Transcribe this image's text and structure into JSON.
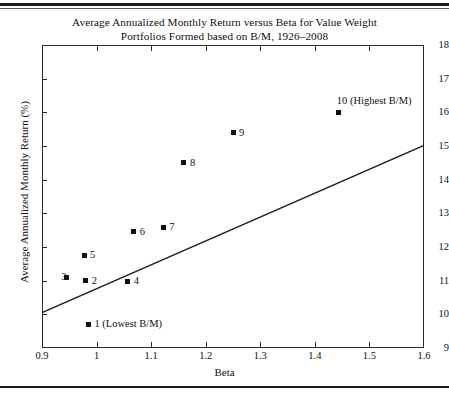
{
  "chart_data": {
    "type": "scatter",
    "title": "Average Annualized Monthly Return versus Beta for Value Weight Portfolios Formed based on B/M, 1926–2008",
    "title_line1": "Average Annualized Monthly Return versus Beta for Value Weight",
    "title_line2": "Portfolios Formed based on B/M, 1926–2008",
    "xlabel": "Beta",
    "ylabel": "Average Annualized Monthly Return (%)",
    "xlim": [
      0.9,
      1.6
    ],
    "ylim": [
      9,
      18
    ],
    "xticks": [
      0.9,
      1.0,
      1.1,
      1.2,
      1.3,
      1.4,
      1.5,
      1.6
    ],
    "xticklabels": [
      "0.9",
      "1",
      "1.1",
      "1.2",
      "1.3",
      "1.4",
      "1.5",
      "1.6"
    ],
    "yticks": [
      9,
      10,
      11,
      12,
      13,
      14,
      15,
      16,
      17,
      18
    ],
    "yticklabels": [
      "9",
      "10",
      "11",
      "12",
      "13",
      "14",
      "15",
      "16",
      "17",
      "18"
    ],
    "grid": false,
    "legend": false,
    "points": [
      {
        "label": "1 (Lowest B/M)",
        "x": 0.985,
        "y": 9.7,
        "label_pos": "right"
      },
      {
        "label": "2",
        "x": 0.98,
        "y": 11.0,
        "label_pos": "right"
      },
      {
        "label": "3",
        "x": 0.945,
        "y": 11.1,
        "label_pos": "left"
      },
      {
        "label": "4",
        "x": 1.057,
        "y": 10.98,
        "label_pos": "right"
      },
      {
        "label": "5",
        "x": 0.977,
        "y": 11.75,
        "label_pos": "right"
      },
      {
        "label": "6",
        "x": 1.068,
        "y": 12.45,
        "label_pos": "right"
      },
      {
        "label": "7",
        "x": 1.122,
        "y": 12.58,
        "label_pos": "right"
      },
      {
        "label": "8",
        "x": 1.16,
        "y": 14.5,
        "label_pos": "right"
      },
      {
        "label": "9",
        "x": 1.25,
        "y": 15.4,
        "label_pos": "right"
      },
      {
        "label": "10 (Highest B/M)",
        "x": 1.444,
        "y": 16.0,
        "label_pos": "above"
      }
    ],
    "line": {
      "name": "security-market-line",
      "x0": 0.9,
      "y0": 10.05,
      "x1": 1.6,
      "y1": 15.02
    },
    "colors": {
      "marker": "#111111",
      "line": "#1a1a1a",
      "axis": "#2b2b2b",
      "background": "#ffffff"
    }
  }
}
